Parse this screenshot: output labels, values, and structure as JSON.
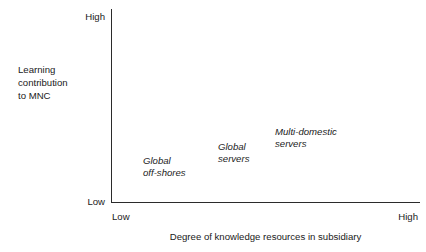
{
  "chart_data": {
    "type": "scatter",
    "title": "",
    "xlabel": "Degree of knowledge resources in subsidiary",
    "ylabel": "Learning\ncontribution\nto MNC",
    "x_ticks": [
      "Low",
      "High"
    ],
    "y_ticks": [
      "Low",
      "High"
    ],
    "xlim": [
      "Low",
      "High"
    ],
    "ylim": [
      "Low",
      "High"
    ],
    "grid": false,
    "legend": "none",
    "annotations": [
      {
        "label": "Global\noff-shores",
        "x_rel": 0.12,
        "y_rel": 0.23
      },
      {
        "label": "Global\nservers",
        "x_rel": 0.36,
        "y_rel": 0.31
      },
      {
        "label": "Multi-domestic\nservers",
        "x_rel": 0.55,
        "y_rel": 0.39
      }
    ]
  },
  "axes": {
    "y": {
      "title": "Learning\ncontribution\nto MNC",
      "high_label": "High",
      "low_label": "Low"
    },
    "x": {
      "title": "Degree of knowledge resources in subsidiary",
      "low_label": "Low",
      "high_label": "High"
    }
  },
  "labels": {
    "item_0": "Global\noff-shores",
    "item_1": "Global\nservers",
    "item_2": "Multi-domestic\nservers"
  },
  "colors": {
    "axis": "#2b2b2b",
    "text": "#1a1a1a",
    "background": "#ffffff"
  },
  "bottom_sliver": ""
}
